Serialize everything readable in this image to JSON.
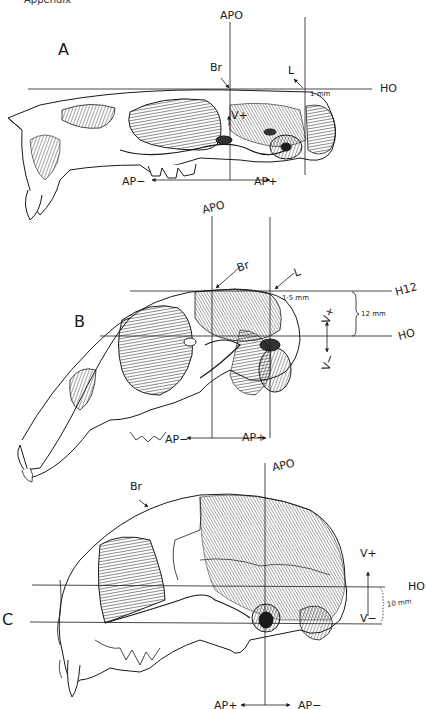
{
  "header": {
    "text": "Appendix"
  },
  "panels": {
    "A": {
      "letter": "A",
      "labels": {
        "apo": "APO",
        "br": "Br",
        "l": "L",
        "ho": "HO",
        "scale": "1 mm",
        "v_plus": "V+",
        "ap_minus": "AP−",
        "ap_plus": "AP+"
      }
    },
    "B": {
      "letter": "B",
      "labels": {
        "apo": "APO",
        "br": "Br",
        "l": "L",
        "h12": "H12",
        "ho": "HO",
        "scale_small": "1·5 mm",
        "scale_gap": "12 mm",
        "v_plus": "V+",
        "v_minus": "V−",
        "ap_minus": "AP−",
        "ap_plus": "AP+"
      }
    },
    "C": {
      "letter": "C",
      "labels": {
        "apo": "APO",
        "br": "Br",
        "ho": "HO",
        "scale_gap": "10 mm",
        "v_plus": "V+",
        "v_minus": "V−",
        "ap_plus": "AP+",
        "ap_minus": "AP−"
      }
    }
  },
  "colors": {
    "ink": "#1a1a1a",
    "paper": "#ffffff",
    "shade": "#555555"
  }
}
